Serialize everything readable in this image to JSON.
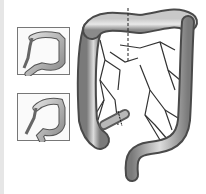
{
  "figure": {
    "insets": [
      {
        "name": "colon-variant-1"
      },
      {
        "name": "colon-variant-2"
      }
    ],
    "colors": {
      "bowel_light": "#d8d8d8",
      "bowel_mid": "#9a9a9a",
      "bowel_dark": "#555555",
      "vessels": "#333333",
      "background": "#ffffff"
    }
  }
}
